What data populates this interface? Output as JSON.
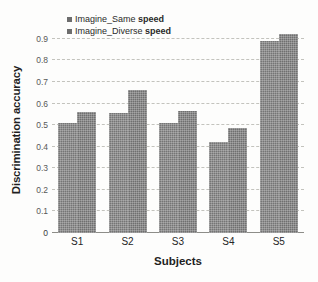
{
  "chart_data": {
    "type": "bar",
    "title": "",
    "xlabel": "Subjects",
    "ylabel": "Discrimination accuracy",
    "categories": [
      "S1",
      "S2",
      "S3",
      "S4",
      "S5"
    ],
    "series": [
      {
        "name": "Imagine_Same speed",
        "name_prefix": "Imagine_Same",
        "name_suffix": "speed",
        "color": "#757575",
        "values": [
          0.51,
          0.555,
          0.51,
          0.42,
          0.89
        ]
      },
      {
        "name": "Imagine_Diverse speed",
        "name_prefix": "Imagine_Diverse",
        "name_suffix": "speed",
        "color": "#6f6f6f",
        "values": [
          0.56,
          0.665,
          0.565,
          0.485,
          0.92
        ]
      }
    ],
    "ylim": [
      0,
      0.95
    ],
    "yticks": [
      0,
      0.1,
      0.2,
      0.3,
      0.4,
      0.5,
      0.6,
      0.7,
      0.8,
      0.9
    ],
    "ytick_labels": [
      "0",
      "0.1",
      "0.2",
      "0.3",
      "0.4",
      "0.5",
      "0.6",
      "0.7",
      "0.8",
      "0.9"
    ],
    "grid": true,
    "grid_style": "dashed",
    "grid_color": "#b9b9b3",
    "legend_position": "top-left"
  }
}
